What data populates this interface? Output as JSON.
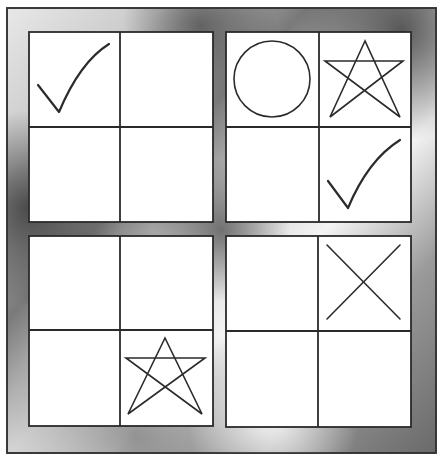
{
  "puzzle": {
    "type": "2x2 grid of 2x2 panels",
    "frame_colors": {
      "light": "#f2f2f2",
      "mid": "#b8b8b8",
      "dark": "#5a5a5a",
      "border": "#333333"
    },
    "panels": [
      {
        "id": "top-left",
        "cells": [
          "check",
          "empty",
          "empty",
          "empty"
        ]
      },
      {
        "id": "top-right",
        "cells": [
          "circle",
          "star",
          "empty",
          "check"
        ]
      },
      {
        "id": "bottom-left",
        "cells": [
          "empty",
          "empty",
          "empty",
          "star"
        ]
      },
      {
        "id": "bottom-right",
        "cells": [
          "empty",
          "cross",
          "empty",
          "empty"
        ]
      }
    ],
    "symbol_legend": {
      "check": "check-mark-icon",
      "circle": "circle-icon",
      "star": "pentagram-star-icon",
      "cross": "x-cross-icon",
      "empty": "blank"
    }
  }
}
